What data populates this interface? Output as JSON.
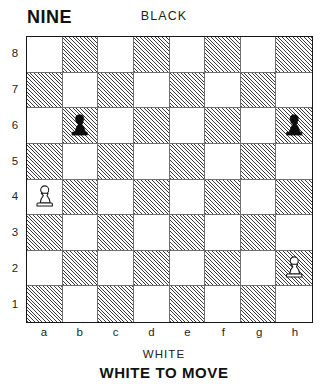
{
  "header": {
    "puzzle_title": "NINE",
    "black_label": "BLACK"
  },
  "footer": {
    "white_label": "WHITE",
    "to_move_label": "WHITE TO MOVE"
  },
  "board": {
    "files": [
      "a",
      "b",
      "c",
      "d",
      "e",
      "f",
      "g",
      "h"
    ],
    "ranks": [
      "8",
      "7",
      "6",
      "5",
      "4",
      "3",
      "2",
      "1"
    ],
    "light_square_color": "#ffffff",
    "dark_square_color": "#3a3a3a",
    "border_color": "#151515",
    "dark_square_style": "diagonal-hatching",
    "orientation": "white-bottom"
  },
  "chart_data": {
    "type": "table",
    "title": "NINE",
    "side_to_move": "white",
    "pieces": [
      {
        "piece": "pawn",
        "color": "black",
        "square": "b6",
        "file": "b",
        "rank": "6",
        "glyph": "black-pawn-icon"
      },
      {
        "piece": "pawn",
        "color": "black",
        "square": "h6",
        "file": "h",
        "rank": "6",
        "glyph": "black-pawn-icon"
      },
      {
        "piece": "pawn",
        "color": "white",
        "square": "a4",
        "file": "a",
        "rank": "4",
        "glyph": "white-pawn-icon"
      },
      {
        "piece": "pawn",
        "color": "white",
        "square": "h2",
        "file": "h",
        "rank": "2",
        "glyph": "white-pawn-icon"
      }
    ],
    "fen": "8/8/1p5p/8/P7/8/7P/8 w - - 0 1"
  }
}
